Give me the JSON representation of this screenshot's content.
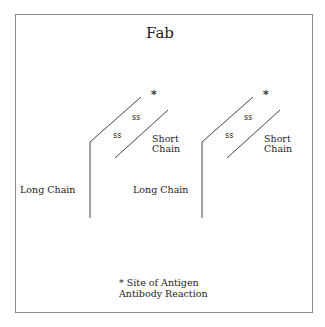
{
  "title": "Fab",
  "colors": {
    "line": "#444444",
    "frame": "#8a8a8a",
    "text": "#222222"
  },
  "arms": [
    {
      "star": "*",
      "ss_upper": "ss",
      "ss_lower": "ss",
      "short_chain": [
        "Short",
        "Chain"
      ],
      "long_chain": "Long Chain"
    },
    {
      "star": "*",
      "ss_upper": "ss",
      "ss_lower": "ss",
      "short_chain": [
        "Short",
        "Chain"
      ],
      "long_chain": "Long Chain"
    }
  ],
  "legend": {
    "line1": "* Site of Antigen",
    "line2": "Antibody Reaction"
  }
}
